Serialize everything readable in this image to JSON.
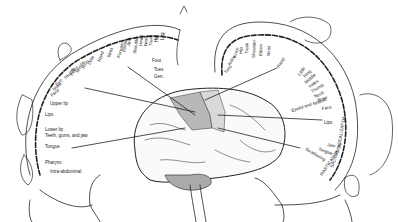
{
  "diagram": {
    "sensory": {
      "labels_radial": [
        "Face",
        "Nose",
        "Eye",
        "Thumb",
        "Index",
        "Middle",
        "Ring",
        "Little",
        "Hand",
        "Wrist",
        "Forearm",
        "Elbow",
        "Arm",
        "Shoulder",
        "Head",
        "Neck",
        "Trunk",
        "Hip",
        "Leg"
      ],
      "labels_foot": [
        "Foot",
        "Toes",
        "Gen."
      ],
      "labels_lower": [
        "Upper lip",
        "Lips",
        "Lower lip",
        "Teeth, gums, and jaw",
        "Tongue",
        "Pharynx",
        "Intra-abdominal"
      ]
    },
    "motor": {
      "labels_top": [
        "Toes",
        "Ankle",
        "Knee",
        "Hip",
        "Trunk",
        "Shoulder",
        "Elbow",
        "Wrist"
      ],
      "hand_label": "Hand",
      "labels_right": [
        "Little",
        "Ring",
        "Middle",
        "Index",
        "Thumb",
        "Neck",
        "Brow",
        "Eyelid and eyeball",
        "Face",
        "Lips",
        "Jaw",
        "Tongue",
        "Swallowing"
      ],
      "vertical_labels": [
        "VOCALIZATION",
        "SALIVATION",
        "MASTICATION"
      ]
    },
    "colors": {
      "ink": "#222222",
      "motor_area": "#b8b8b8",
      "sensory_area": "#d9d9d9",
      "background": "#ffffff"
    }
  }
}
